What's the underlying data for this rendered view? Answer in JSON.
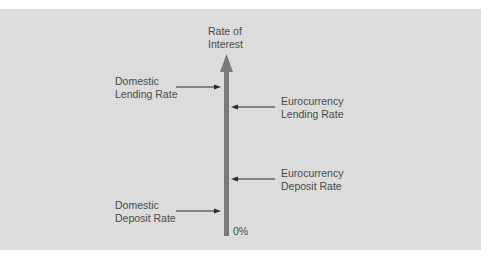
{
  "diagram": {
    "axis": {
      "title_line1": "Rate of",
      "title_line2": "Interest",
      "zero_label": "0%",
      "axis_color": "#7a7a7a"
    },
    "labels": {
      "domestic_lending": {
        "line1": "Domestic",
        "line2": "Lending Rate"
      },
      "euro_lending": {
        "line1": "Eurocurrency",
        "line2": "Lending Rate"
      },
      "euro_deposit": {
        "line1": "Eurocurrency",
        "line2": "Deposit Rate"
      },
      "domestic_deposit": {
        "line1": "Domestic",
        "line2": "Deposit Rate"
      }
    },
    "colors": {
      "background": "#dcdcdc",
      "text": "#4a4a4a",
      "pointer": "#2a2a2a"
    }
  }
}
